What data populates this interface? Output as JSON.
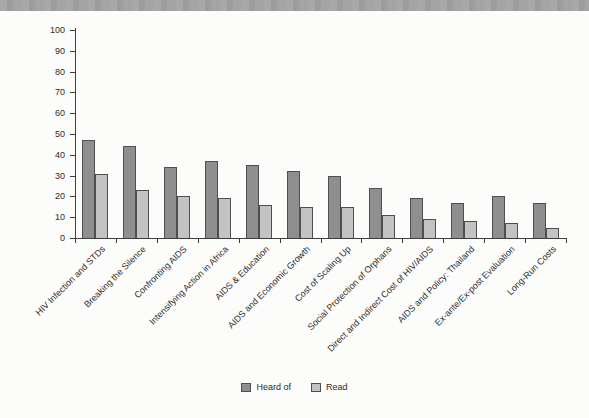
{
  "page": {
    "header_strip_color": "#a4a4a4",
    "background_color": "#fcfcfb"
  },
  "chart_data": {
    "type": "bar",
    "title": "",
    "xlabel": "",
    "ylabel": "",
    "categories": [
      "HIV Infection and STDs",
      "Breaking the Silence",
      "Confronting AIDS",
      "Intensifying Action in Africa",
      "AIDS & Education",
      "AIDS and Economic Growth",
      "Cost of Scaling Up",
      "Social Protection of Orphans",
      "Direct and Indirect Cost of HIV/AIDS",
      "AIDS and Policy: Thailand",
      "Ex-ante/Ex-post Evaluation",
      "Long-Run Costs"
    ],
    "series": [
      {
        "name": "Heard of",
        "color": "#8f8f8f",
        "values": [
          47,
          44,
          34,
          37,
          35,
          32,
          30,
          24,
          19,
          17,
          20,
          17
        ]
      },
      {
        "name": "Read",
        "color": "#c3c3c3",
        "values": [
          31,
          23,
          20,
          19,
          16,
          15,
          15,
          11,
          9,
          8,
          7,
          5
        ]
      }
    ],
    "ylim": [
      0,
      100
    ],
    "yticks": [
      0,
      10,
      20,
      30,
      40,
      50,
      60,
      70,
      80,
      90,
      100
    ],
    "grid": false,
    "legend_position": "bottom",
    "bar_border_color": "#4f4f4f",
    "axis_color": "#3f3f3f",
    "text_color": "#2d2d2d"
  }
}
